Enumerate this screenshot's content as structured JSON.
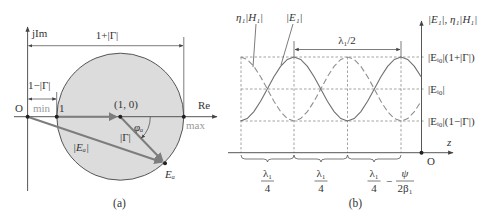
{
  "panel_a": {
    "caption": "(a)",
    "axis_imag_label": "jIm",
    "axis_real_label": "Re",
    "origin_label": "O",
    "point_one_label": "1",
    "center_label": "(1, 0)",
    "min_label": "min",
    "max_label": "max",
    "dim_total_label": "1+|Γ|",
    "dim_min_label": "1−|Γ|",
    "angle_label": "φₐ",
    "gamma_mag_label": "|Γ|",
    "ea_mag_label": "|Eₐ|",
    "ea_point_label": "Eₐ",
    "colors": {
      "circle_fill": "#dcdcdc",
      "vector": "#7d7d7d"
    }
  },
  "panel_b": {
    "caption": "(b)",
    "h_curve_label": "η₁|H₁|",
    "e_curve_label": "|E₁|",
    "half_wavelength_label": "λ₁/2",
    "vertical_axis_label": "|E₁|, η₁|H₁|",
    "level_max_label": "|Eᵢ₀|(1+|Γ|)",
    "level_mid_label": "|Eᵢ₀|",
    "level_min_label": "|Eᵢ₀|(1−|Γ|)",
    "z_axis_label": "z",
    "origin_label": "O",
    "segments": [
      {
        "numerator": "λ₁",
        "denominator": "4"
      },
      {
        "numerator": "λ₁",
        "denominator": "4"
      },
      {
        "numerator": "λ₁",
        "denominator": "4"
      }
    ],
    "offset_term": {
      "sign": "−",
      "numerator": "ψ",
      "denominator": "2β₁"
    }
  }
}
